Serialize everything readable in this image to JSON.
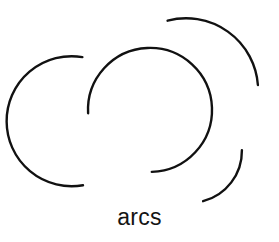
{
  "figure": {
    "caption": "arcs",
    "width": 279,
    "height": 242,
    "background_color": "#ffffff",
    "stroke_color": "#111111",
    "text_color": "#141414",
    "stroke_width": 2.4,
    "shape_count": 4
  },
  "chart_data": {
    "type": "scatter",
    "title": "arcs",
    "xlabel": "",
    "ylabel": "",
    "xlim": [
      0,
      279
    ],
    "ylim": [
      0,
      242
    ],
    "grid": false,
    "legend": "none",
    "arcs": [
      {
        "name": "left-large-arc",
        "center_x": 85,
        "center_y": 121,
        "radius": 65,
        "start_angle_deg": 275,
        "end_angle_deg": 85,
        "sweep_deg": 170,
        "direction": "counterclockwise",
        "start_point": [
          82,
          57
        ],
        "end_point": [
          83,
          185
        ],
        "opening_faces": "right",
        "path": "M 82.4 57.1 A 65 65 0 1 0 83.0 185.2"
      },
      {
        "name": "middle-circle-arc",
        "center_x": 150,
        "center_y": 110,
        "radius": 62,
        "start_angle_deg": 177,
        "end_angle_deg": 93,
        "sweep_deg": 276,
        "direction": "clockwise",
        "start_point": [
          88,
          113
        ],
        "end_point": [
          152,
          172
        ],
        "opening_faces": "lower-left",
        "path": "M 88.1 113.2 A 62 62 0 1 1 151.8 171.9"
      },
      {
        "name": "upper-right-arc",
        "center_x": 186,
        "center_y": 86,
        "radius": 72,
        "start_angle_deg": 245,
        "end_angle_deg": 358,
        "sweep_deg": 113,
        "direction": "clockwise",
        "start_point": [
          168,
          20
        ],
        "end_point": [
          258,
          85
        ],
        "opening_faces": "lower-left",
        "path": "M 167.6 20.7 A 72 72 0 0 1 257.9 85.0"
      },
      {
        "name": "lower-right-arc",
        "center_x": 190,
        "center_y": 152,
        "radius": 52,
        "start_angle_deg": 358,
        "end_angle_deg": 109,
        "sweep_deg": 111,
        "direction": "clockwise",
        "start_point": [
          242,
          150
        ],
        "end_point": [
          203,
          202
        ],
        "opening_faces": "upper-left",
        "path": "M 241.9 150.2 A 52 52 0 0 1 203.1 201.2"
      }
    ]
  }
}
